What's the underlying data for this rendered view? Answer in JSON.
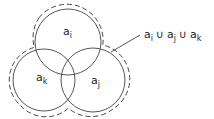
{
  "diagram": {
    "type": "venn",
    "title": "",
    "sets": [
      {
        "id": "ai",
        "base": "a",
        "sub": "i",
        "cx": 68,
        "cy": 42,
        "r": 33
      },
      {
        "id": "aj",
        "base": "a",
        "sub": "j",
        "cx": 93,
        "cy": 80,
        "r": 32
      },
      {
        "id": "ak",
        "base": "a",
        "sub": "k",
        "cx": 44,
        "cy": 80,
        "r": 31
      }
    ],
    "union_label": {
      "parts": [
        {
          "base": "a",
          "sub": "i"
        },
        {
          "op": "∪"
        },
        {
          "base": "a",
          "sub": "j"
        },
        {
          "op": "∪"
        },
        {
          "base": "a",
          "sub": "k"
        }
      ],
      "text": "ai ∪ aj ∪ ak"
    },
    "colors": {
      "stroke": "#555555",
      "dashed": "#444444",
      "text": "#222222",
      "background": "#ffffff"
    }
  }
}
